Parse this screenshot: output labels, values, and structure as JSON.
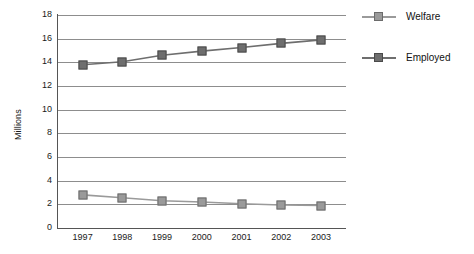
{
  "chart_data": {
    "type": "line",
    "title": "",
    "xlabel": "",
    "ylabel": "Millions",
    "categories": [
      "1997",
      "1998",
      "1999",
      "2000",
      "2001",
      "2002",
      "2003"
    ],
    "ylim": [
      0,
      18
    ],
    "ytick_step": 2,
    "yticks": [
      "18",
      "16",
      "14",
      "12",
      "10",
      "8",
      "6",
      "4",
      "2",
      "0"
    ],
    "grid": "horizontal",
    "legend_position": "right",
    "series": [
      {
        "name": "Welfare",
        "color": "#9a9a9a",
        "marker": "square",
        "values": [
          2.8,
          2.55,
          2.3,
          2.2,
          2.05,
          1.95,
          1.9
        ]
      },
      {
        "name": "Employed",
        "color": "#6e6e6e",
        "marker": "square",
        "values": [
          13.8,
          14.05,
          14.6,
          14.95,
          15.25,
          15.6,
          15.9
        ]
      }
    ]
  },
  "axis": {
    "y_title": "Millions"
  },
  "legend": {
    "items": [
      {
        "label": "Welfare",
        "color": "#9a9a9a"
      },
      {
        "label": "Employed",
        "color": "#6e6e6e"
      }
    ]
  },
  "colors": {
    "welfare": "#9a9a9a",
    "employed": "#6e6e6e",
    "grid": "#8d8d8d",
    "axis": "#555555",
    "text": "#1a1a1a",
    "background": "#ffffff"
  }
}
